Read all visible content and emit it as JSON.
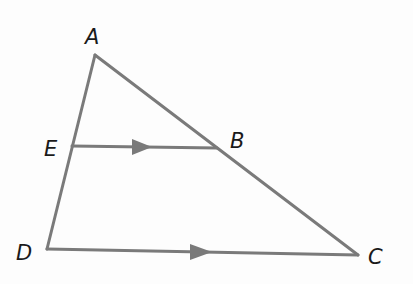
{
  "diagram": {
    "type": "geometry-triangle",
    "stroke_color": "#7a7a7a",
    "label_color": "#1a1a1a",
    "points": {
      "A": {
        "label": "A",
        "x": 95,
        "y": 55
      },
      "E": {
        "label": "E",
        "x": 72,
        "y": 146
      },
      "B": {
        "label": "B",
        "x": 217,
        "y": 148
      },
      "D": {
        "label": "D",
        "x": 47,
        "y": 249
      },
      "C": {
        "label": "C",
        "x": 358,
        "y": 255
      }
    },
    "segments": [
      "AD",
      "AC",
      "DC",
      "EB"
    ],
    "parallel_marks": [
      "EB",
      "DC"
    ],
    "note": "EB is parallel to DC"
  }
}
